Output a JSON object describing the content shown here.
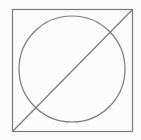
{
  "diagram": {
    "canvas": {
      "width": 141,
      "height": 140,
      "background": "#fcfcfc"
    },
    "stroke_color": "#7a7a7a",
    "stroke_width": 1.2,
    "shapes": {
      "square": {
        "x": 12,
        "y": 9,
        "width": 120,
        "height": 122
      },
      "circle": {
        "cx": 72,
        "cy": 69,
        "r": 53
      },
      "diagonal": {
        "x1": 12,
        "y1": 131,
        "x2": 132,
        "y2": 9
      }
    }
  }
}
